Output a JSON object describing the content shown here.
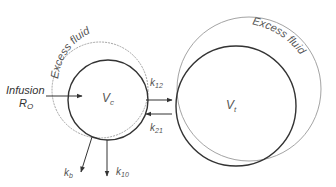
{
  "diagram": {
    "type": "two-compartment volume kinetics model",
    "central": {
      "label": "V",
      "subscript": "c",
      "excess_label": "Excess fluid"
    },
    "peripheral": {
      "label": "V",
      "subscript": "t",
      "excess_label": "Excess fluid"
    },
    "infusion": {
      "line1": "Infusion",
      "line2": "R",
      "line2_sub": "O"
    },
    "rates": {
      "k12": {
        "base": "k",
        "sub": "12"
      },
      "k21": {
        "base": "k",
        "sub": "21"
      },
      "kb": {
        "base": "k",
        "sub": "b"
      },
      "k10": {
        "base": "k",
        "sub": "10"
      }
    },
    "colors": {
      "inner_circle": "#333333",
      "outer_circle": "#999999",
      "arrow": "#333333",
      "label": "#555555"
    }
  }
}
